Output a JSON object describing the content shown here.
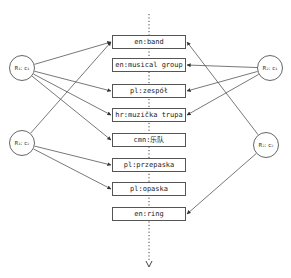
{
  "diagram": {
    "type": "graph",
    "nodes": {
      "senses": [
        {
          "id": "band",
          "label": "en:band",
          "y": 35
        },
        {
          "id": "musical_group",
          "label": "en:musical group",
          "y": 58
        },
        {
          "id": "zespol",
          "label": "pl:zespół",
          "y": 84
        },
        {
          "id": "muzicka_trupa",
          "label": "hr:muzička trupa",
          "y": 108
        },
        {
          "id": "yuedui",
          "label": "cmn:乐队",
          "y": 133
        },
        {
          "id": "przepaska",
          "label": "pl:przepaska",
          "y": 158
        },
        {
          "id": "opaska",
          "label": "pl:opaska",
          "y": 182
        },
        {
          "id": "ring",
          "label": "en:ring",
          "y": 207
        }
      ],
      "clusters": [
        {
          "id": "r1c1",
          "label": "R₁: c₁",
          "cx": 22,
          "cy": 68
        },
        {
          "id": "r1c2",
          "label": "R₁: c₂",
          "cx": 22,
          "cy": 143
        },
        {
          "id": "r2c1",
          "label": "R₂: c₁",
          "cx": 270,
          "cy": 68
        },
        {
          "id": "r2c2",
          "label": "R₂: c₂",
          "cx": 266,
          "cy": 145
        }
      ]
    },
    "edges": [
      {
        "from": "r1c1",
        "to": "band"
      },
      {
        "from": "r1c1",
        "to": "zespol"
      },
      {
        "from": "r1c1",
        "to": "muzicka_trupa"
      },
      {
        "from": "r1c1",
        "to": "yuedui"
      },
      {
        "from": "r1c2",
        "to": "band"
      },
      {
        "from": "r1c2",
        "to": "przepaska"
      },
      {
        "from": "r1c2",
        "to": "opaska"
      },
      {
        "from": "r2c1",
        "to": "musical_group"
      },
      {
        "from": "r2c1",
        "to": "zespol"
      },
      {
        "from": "r2c1",
        "to": "muzicka_trupa"
      },
      {
        "from": "r2c2",
        "to": "band"
      },
      {
        "from": "r2c2",
        "to": "ring"
      }
    ],
    "colors": {
      "stroke": "#555555",
      "text": "#222222",
      "background": "#ffffff"
    }
  }
}
